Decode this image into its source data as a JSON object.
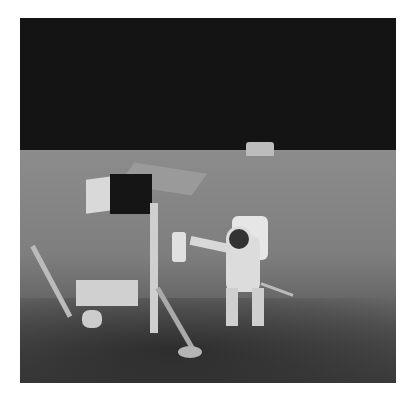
{
  "image": {
    "description": "Black-and-white lunar surface photograph: an astronaut in a spacesuit stands beside the Surveyor 3 spacecraft, with the lunar module visible on the horizon against a black sky.",
    "subjects": [
      "astronaut",
      "surveyor-spacecraft",
      "lunar-module",
      "lunar-surface",
      "black-sky"
    ],
    "palette": {
      "sky": "#141414",
      "ground_light": "#8c8c8c",
      "ground_dark": "#3c3c3c",
      "suit": "#dcdcdc",
      "border": "#ffffff"
    }
  }
}
